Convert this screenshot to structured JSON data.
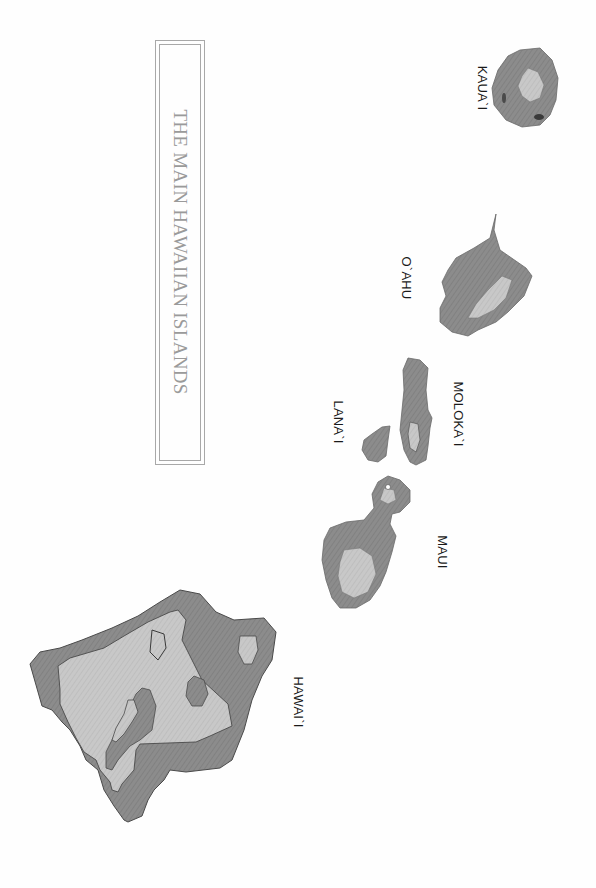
{
  "map": {
    "title": "THE MAIN HAWAIIAN ISLANDS",
    "orientation": "rotated 90° clockwise",
    "colors": {
      "island_fill": "#8a8a8a",
      "highland_fill": "#c4c4c4",
      "outline": "#4a4a4a",
      "title_text": "#9a9a9a",
      "label_text": "#1a1a1a"
    },
    "islands": [
      {
        "id": "kauai",
        "label": "KAUA`I"
      },
      {
        "id": "oahu",
        "label": "O`AHU"
      },
      {
        "id": "molokai",
        "label": "MOLOKA`I"
      },
      {
        "id": "lanai",
        "label": "LANA`I"
      },
      {
        "id": "maui",
        "label": "MAUI"
      },
      {
        "id": "hawaii",
        "label": "HAWAI`I"
      }
    ]
  }
}
